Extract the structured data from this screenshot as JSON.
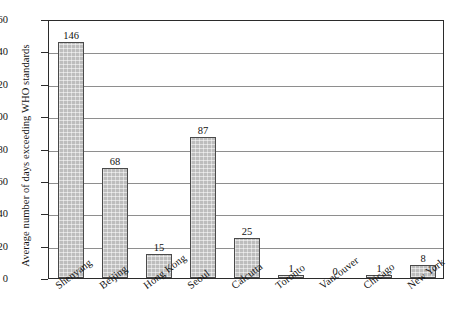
{
  "chart_data": {
    "type": "bar",
    "title": "",
    "xlabel": "",
    "ylabel": "Average number of days exceeding WHO standards",
    "ylim": [
      0,
      160
    ],
    "ytick_step": 20,
    "yticks": [
      "0",
      "20",
      "40",
      "60",
      "80",
      "100",
      "120",
      "140",
      "160"
    ],
    "grid": "horizontal",
    "legend": "none",
    "categories": [
      "Shenyang",
      "Beijing",
      "Hong Kong",
      "Seoul",
      "Calcutta",
      "Toronto",
      "Vancouver",
      "Chicago",
      "New York"
    ],
    "values": [
      146,
      68,
      15,
      87,
      25,
      1,
      0,
      1,
      8
    ],
    "value_labels": [
      "146",
      "68",
      "15",
      "87",
      "25",
      "1",
      "0",
      "1",
      "8"
    ],
    "bar_fill_color": "#bdbdbd",
    "bar_edge_color": "#4a4a4a",
    "gridline_color": "#8e8e8e",
    "axis_color": "#2b2b2b"
  }
}
